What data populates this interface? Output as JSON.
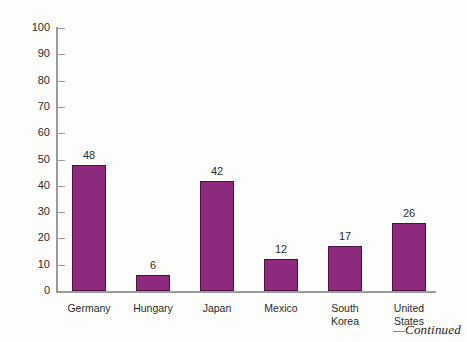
{
  "figure": {
    "footer_note": "—Continued",
    "background_color": "#fdfdfc",
    "axis_color": "#9a9a9a"
  },
  "chart_data": {
    "type": "bar",
    "title": "",
    "subtitle": "",
    "xlabel": "",
    "ylabel": "",
    "categories": [
      "Germany",
      "Hungary",
      "Japan",
      "Mexico",
      "South Korea",
      "United States"
    ],
    "category_lines": [
      [
        "Germany"
      ],
      [
        "Hungary"
      ],
      [
        "Japan"
      ],
      [
        "Mexico"
      ],
      [
        "South",
        "Korea"
      ],
      [
        "United",
        "States"
      ]
    ],
    "values": [
      48,
      6,
      42,
      12,
      17,
      26
    ],
    "value_labels": [
      "48",
      "6",
      "42",
      "12",
      "17",
      "26"
    ],
    "ylim": [
      0,
      100
    ],
    "ytick_values": [
      0,
      10,
      20,
      30,
      40,
      50,
      60,
      70,
      80,
      90,
      100
    ],
    "ytick_labels": [
      "0",
      "10",
      "20",
      "30",
      "40",
      "50",
      "60",
      "70",
      "80",
      "90",
      "100"
    ],
    "grid": false,
    "legend": null,
    "bar_color": "#8e2a7e",
    "bar_edge_color": "#4a1440"
  }
}
